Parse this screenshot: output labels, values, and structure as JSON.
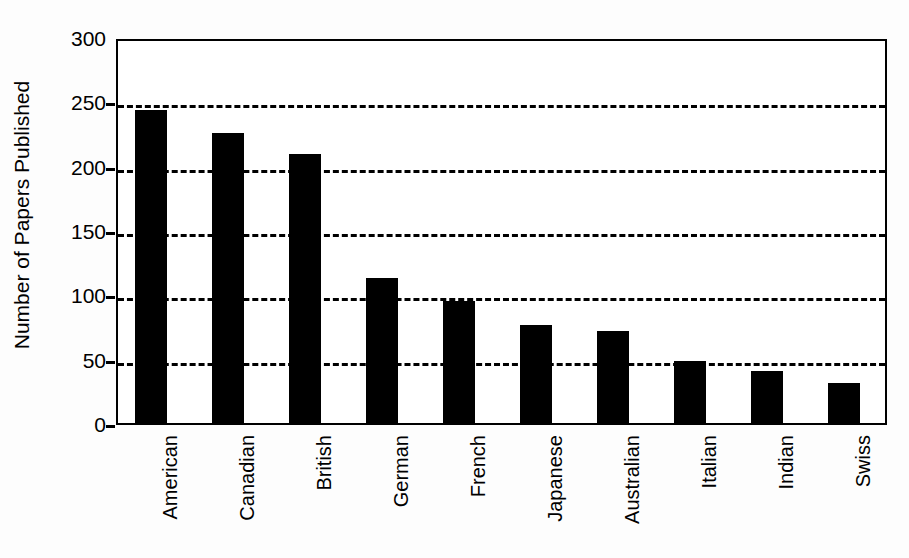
{
  "chart_data": {
    "type": "bar",
    "title": "",
    "xlabel": "",
    "ylabel": "Number of Papers Published",
    "categories": [
      "American",
      "Canadian",
      "British",
      "German",
      "French",
      "Japanese",
      "Australian",
      "Italian",
      "Indian",
      "Swiss"
    ],
    "values": [
      245,
      227,
      211,
      114,
      96,
      78,
      73,
      50,
      42,
      33
    ],
    "ylim": [
      0,
      300
    ],
    "yticks": [
      0,
      50,
      100,
      150,
      200,
      250,
      300
    ],
    "ytick_labels": [
      "0",
      "50",
      "100",
      "150",
      "200",
      "250",
      "300"
    ],
    "grid": "horizontal-dashed",
    "legend": "none",
    "bar_color": "#000000",
    "axis_color": "#000000",
    "background_color": "#ffffff"
  }
}
